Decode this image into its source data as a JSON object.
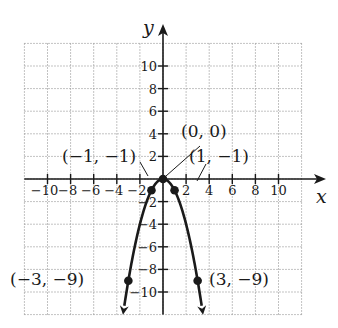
{
  "chart_data": {
    "type": "line",
    "title": "",
    "function": "y = -x^2",
    "xlabel": "x",
    "ylabel": "y",
    "xlim": [
      -12,
      12
    ],
    "ylim": [
      -12,
      12
    ],
    "grid": true,
    "grid_step": 2,
    "x_ticks": [
      -10,
      -8,
      -6,
      -4,
      -2,
      2,
      4,
      6,
      8,
      10
    ],
    "x_tick_labels": [
      "−10",
      "−8",
      "−6",
      "−4",
      "−2",
      "2",
      "4",
      "6",
      "8",
      "10"
    ],
    "y_ticks": [
      10,
      8,
      6,
      4,
      2,
      -2,
      -4,
      -6,
      -8,
      -10
    ],
    "y_tick_labels": [
      "10",
      "8",
      "6",
      "4",
      "2",
      "−2",
      "−4",
      "−6",
      "−8",
      "−10"
    ],
    "series": [
      {
        "name": "y = -x^2",
        "x": [
          -3.4,
          -3,
          -2,
          -1,
          0,
          1,
          2,
          3,
          3.4
        ],
        "y": [
          -11.56,
          -9,
          -4,
          -1,
          0,
          -1,
          -4,
          -9,
          -11.56
        ],
        "color": "#1a1a1a",
        "arrows_at_ends": true
      }
    ],
    "points": [
      {
        "x": -3,
        "y": -9,
        "label": "(−3, −9)"
      },
      {
        "x": -1,
        "y": -1,
        "label": "(−1, −1)"
      },
      {
        "x": 0,
        "y": 0,
        "label": "(0, 0)"
      },
      {
        "x": 1,
        "y": -1,
        "label": "(1, −1)"
      },
      {
        "x": 3,
        "y": -9,
        "label": "(3, −9)"
      }
    ],
    "colors": {
      "curve": "#1a1a1a",
      "axes": "#1a1a1a",
      "grid": "#9a9a9a",
      "background": "#ffffff"
    }
  }
}
